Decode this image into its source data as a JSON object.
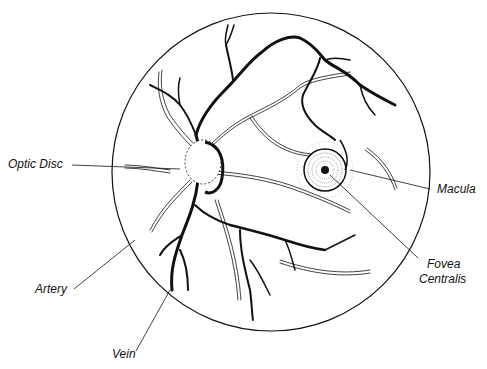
{
  "figure": {
    "labels": {
      "optic_disc": "Optic Disc",
      "macula": "Macula",
      "fovea_line1": "Fovea",
      "fovea_line2": "Centralis",
      "artery": "Artery",
      "vein": "Vein"
    },
    "colors": {
      "ink": "#111111",
      "background": "#ffffff"
    }
  }
}
